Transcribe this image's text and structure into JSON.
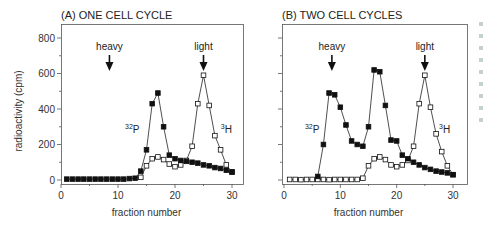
{
  "chart_data": [
    {
      "type": "line",
      "title": "(A) ONE CELL CYCLE",
      "xlabel": "fraction number",
      "ylabel": "radioactivity (cpm)",
      "xlim": [
        0,
        32
      ],
      "ylim": [
        0,
        800
      ],
      "xticks": [
        0,
        10,
        20,
        30
      ],
      "yticks": [
        0,
        200,
        400,
        600,
        800
      ],
      "grid": false,
      "annotations": [
        {
          "text": "heavy",
          "x": 8.5,
          "arrow": true
        },
        {
          "text": "light",
          "x": 25,
          "arrow": true
        },
        {
          "text": "32P",
          "x": 12.5,
          "y": 290,
          "superscript": "32",
          "base": "P"
        },
        {
          "text": "3H",
          "x": 29,
          "y": 290,
          "superscript": "3",
          "base": "H"
        }
      ],
      "x": [
        1,
        2,
        3,
        4,
        5,
        6,
        7,
        8,
        9,
        10,
        11,
        12,
        13,
        14,
        15,
        16,
        17,
        18,
        19,
        20,
        21,
        22,
        23,
        24,
        25,
        26,
        27,
        28,
        29,
        30
      ],
      "series": [
        {
          "name": "32P",
          "marker": "filled-square",
          "values": [
            5,
            5,
            5,
            5,
            5,
            5,
            5,
            5,
            5,
            5,
            5,
            8,
            10,
            50,
            170,
            430,
            490,
            300,
            140,
            120,
            110,
            105,
            100,
            95,
            85,
            80,
            70,
            65,
            55,
            45
          ]
        },
        {
          "name": "3H",
          "marker": "open-square",
          "values": [
            null,
            null,
            null,
            null,
            null,
            null,
            null,
            null,
            null,
            null,
            null,
            null,
            null,
            15,
            80,
            120,
            130,
            115,
            90,
            75,
            85,
            110,
            190,
            430,
            590,
            420,
            250,
            170,
            85,
            45
          ]
        }
      ]
    },
    {
      "type": "line",
      "title": "(B) TWO CELL CYCLES",
      "xlabel": "fraction number",
      "ylabel": "",
      "xlim": [
        0,
        32
      ],
      "ylim": [
        0,
        800
      ],
      "xticks": [
        0,
        10,
        20,
        30
      ],
      "yticks": [
        0,
        200,
        400,
        600,
        800
      ],
      "grid": false,
      "annotations": [
        {
          "text": "heavy",
          "x": 8.5,
          "arrow": true
        },
        {
          "text": "light",
          "x": 25,
          "arrow": true
        },
        {
          "text": "32P",
          "x": 5,
          "y": 290,
          "superscript": "32",
          "base": "P"
        },
        {
          "text": "3H",
          "x": 28.5,
          "y": 290,
          "superscript": "3",
          "base": "H"
        }
      ],
      "x": [
        1,
        2,
        3,
        4,
        5,
        6,
        7,
        8,
        9,
        10,
        11,
        12,
        13,
        14,
        15,
        16,
        17,
        18,
        19,
        20,
        21,
        22,
        23,
        24,
        25,
        26,
        27,
        28,
        29,
        30
      ],
      "series": [
        {
          "name": "32P",
          "marker": "filled-square",
          "values": [
            null,
            null,
            null,
            null,
            null,
            20,
            200,
            490,
            480,
            410,
            310,
            220,
            200,
            190,
            300,
            620,
            610,
            420,
            225,
            220,
            140,
            120,
            100,
            85,
            70,
            60,
            50,
            45,
            40,
            30
          ]
        },
        {
          "name": "3H",
          "marker": "open-square",
          "values": [
            3,
            3,
            2,
            3,
            3,
            3,
            3,
            2,
            3,
            3,
            3,
            3,
            3,
            10,
            80,
            120,
            130,
            115,
            85,
            75,
            85,
            110,
            190,
            430,
            590,
            410,
            260,
            160,
            80,
            30
          ]
        }
      ]
    }
  ],
  "panels": [
    {
      "title": "(A) ONE CELL CYCLE",
      "xlabel": "fraction number",
      "ylabel": "radioactivity (cpm)",
      "heavy": "heavy",
      "light": "light",
      "p_sup": "32",
      "p_base": "P",
      "h_sup": "3",
      "h_base": "H"
    },
    {
      "title": "(B) TWO CELL CYCLES",
      "xlabel": "fraction number",
      "heavy": "heavy",
      "light": "light",
      "p_sup": "32",
      "p_base": "P",
      "h_sup": "3",
      "h_base": "H"
    }
  ]
}
